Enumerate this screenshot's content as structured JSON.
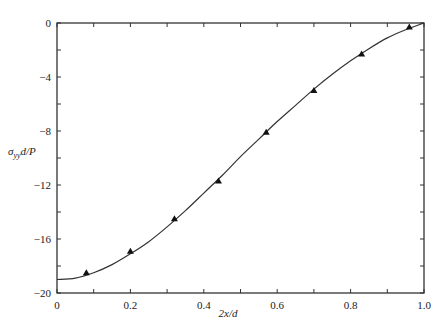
{
  "chart_data": {
    "type": "line",
    "title": "",
    "xlabel": "2x/d",
    "ylabel": "σyy d/P",
    "xlim": [
      0,
      1.0
    ],
    "ylim": [
      -20,
      0
    ],
    "grid": false,
    "x_ticks": [
      "0",
      "0.2",
      "0.4",
      "0.6",
      "0.8",
      "1.0"
    ],
    "y_ticks": [
      "0",
      "-4",
      "-8",
      "-12",
      "-16",
      "-20"
    ],
    "series": [
      {
        "name": "theory",
        "style": "solid-line",
        "x": [
          0,
          0.05,
          0.1,
          0.15,
          0.2,
          0.25,
          0.3,
          0.35,
          0.4,
          0.45,
          0.5,
          0.55,
          0.6,
          0.65,
          0.7,
          0.75,
          0.8,
          0.85,
          0.9,
          0.95,
          1.0
        ],
        "values": [
          -19.0,
          -18.9,
          -18.5,
          -17.9,
          -17.1,
          -16.2,
          -15.1,
          -13.9,
          -12.6,
          -11.3,
          -9.9,
          -8.6,
          -7.3,
          -6.1,
          -4.9,
          -3.8,
          -2.8,
          -1.9,
          -1.1,
          -0.5,
          0
        ]
      },
      {
        "name": "experiment",
        "style": "triangle-markers",
        "x": [
          0.08,
          0.2,
          0.32,
          0.44,
          0.57,
          0.7,
          0.83,
          0.96
        ],
        "values": [
          -18.5,
          -16.9,
          -14.5,
          -11.7,
          -8.1,
          -5.0,
          -2.3,
          -0.3
        ]
      }
    ]
  },
  "labels": {
    "xlabel": "2x/d",
    "ylabel_sigma": "σ",
    "ylabel_sub": "yy",
    "ylabel_rest": "d/P"
  }
}
